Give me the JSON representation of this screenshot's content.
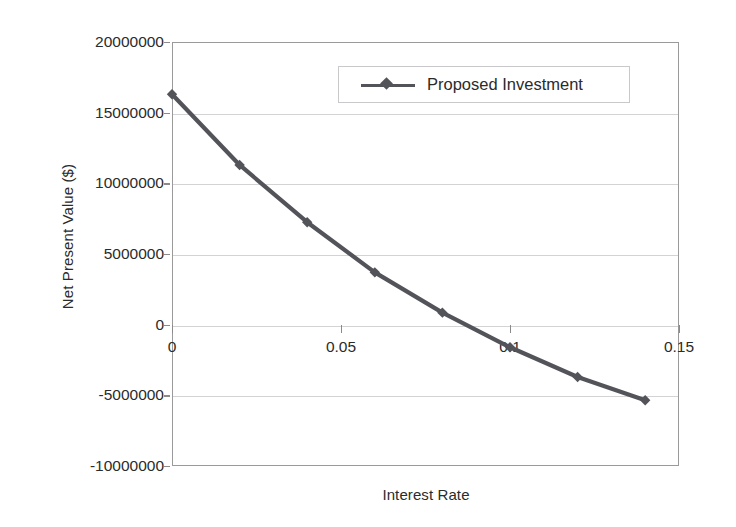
{
  "chart_data": {
    "type": "line",
    "title": "",
    "xlabel": "Interest Rate",
    "ylabel": "Net Present Value ($)",
    "xlim": [
      0,
      0.15
    ],
    "ylim": [
      -10000000,
      20000000
    ],
    "xticks": [
      "0",
      "0.05",
      "0.1",
      "0.15"
    ],
    "xtick_values": [
      0,
      0.05,
      0.1,
      0.15
    ],
    "yticks": [
      "20000000",
      "15000000",
      "10000000",
      "5000000",
      "0",
      "-5000000",
      "-10000000"
    ],
    "ytick_values": [
      20000000,
      15000000,
      10000000,
      5000000,
      0,
      -5000000,
      -10000000
    ],
    "grid": true,
    "legend_position": "top-right-inside",
    "series": [
      {
        "name": "Proposed Investment",
        "marker": "diamond",
        "color": "#53535a",
        "x": [
          0,
          0.02,
          0.04,
          0.06,
          0.08,
          0.1,
          0.12,
          0.14
        ],
        "values": [
          16300000,
          11300000,
          7250000,
          3700000,
          850000,
          -1600000,
          -3700000,
          -5350000
        ]
      }
    ]
  },
  "legend": {
    "entries": [
      {
        "label": "Proposed Investment"
      }
    ]
  },
  "axes": {
    "y_title": "Net Present Value ($)",
    "x_title": "Interest Rate"
  },
  "colors": {
    "series": "#53535a",
    "grid": "#d3d3d6",
    "axis": "#9a9a9a",
    "text": "#2b2b2b",
    "background": "#ffffff"
  }
}
